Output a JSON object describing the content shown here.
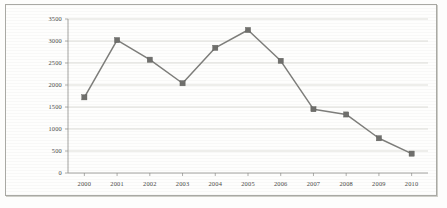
{
  "chart_data": {
    "type": "line",
    "title": "",
    "xlabel": "",
    "ylabel": "",
    "categories": [
      "2000",
      "2001",
      "2002",
      "2003",
      "2004",
      "2005",
      "2006",
      "2007",
      "2008",
      "2009",
      "2010"
    ],
    "values": [
      1720,
      3020,
      2575,
      2040,
      2845,
      3250,
      2550,
      1450,
      1330,
      790,
      440
    ],
    "series": [
      {
        "name": "series-1",
        "values": [
          1720,
          3020,
          2575,
          2040,
          2845,
          3250,
          2550,
          1450,
          1330,
          790,
          440
        ],
        "line_color": "#7e7e7b",
        "marker_color": "#70706d",
        "marker_shape": "square"
      }
    ],
    "ylim": [
      0,
      3500
    ],
    "ytick_values": [
      0,
      500,
      1000,
      1500,
      2000,
      2500,
      3000,
      3500
    ],
    "ytick_labels": [
      "0",
      "500",
      "1000",
      "1500",
      "2000",
      "2500",
      "3000",
      "3500"
    ],
    "xtick_labels": [
      "2000",
      "2001",
      "2002",
      "2003",
      "2004",
      "2005",
      "2006",
      "2007",
      "2008",
      "2009",
      "2010"
    ],
    "grid": "horizontal",
    "legend": "none",
    "plot_background": "#fefefd",
    "grid_color": "#c9c9c4",
    "axis_color": "#8d8d88"
  },
  "frame": {
    "border_color": "#a9a9a4",
    "background": "#fefefd"
  }
}
